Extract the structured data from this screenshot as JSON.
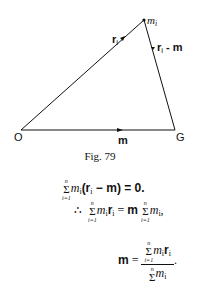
{
  "figure": {
    "points": {
      "O": {
        "label": "O"
      },
      "G": {
        "label": "G"
      },
      "mi": {
        "label": "m",
        "sub": "i"
      }
    },
    "vectors": [
      {
        "label": "r",
        "sub": "i",
        "from": "O",
        "to": "m_i"
      },
      {
        "label": "r",
        "sub": "i",
        "suffix": " - m",
        "from": "G",
        "to": "m_i"
      },
      {
        "label": "m",
        "from": "O",
        "to": "G"
      }
    ],
    "caption": "Fig. 79"
  },
  "equations": {
    "eq1": {
      "sum_top": "n",
      "sum_bot": "i=1",
      "term": "m",
      "sub": "i",
      "paren": "(r",
      "paren_sub": "i",
      "rest": " − m) = 0."
    },
    "eq2": {
      "therefore": "∴",
      "sum_top": "n",
      "sum_bot": "i=1",
      "lhs": "m",
      "lhs_sub": "i",
      "lhs_r": "r",
      "lhs_r_sub": "i",
      "eq": " = ",
      "rhs_m": "m",
      "rhs_term": "m",
      "rhs_sub": "i",
      "end": ","
    },
    "eq3": {
      "lhs": "m",
      "eq": " = ",
      "num_top": "n",
      "num_bot": "i=1",
      "num_term": "m",
      "num_sub": "i",
      "num_r": "r",
      "num_r_sub": "i",
      "den_top": "n",
      "den_term": "m",
      "den_sub": "i",
      "end": "."
    }
  }
}
